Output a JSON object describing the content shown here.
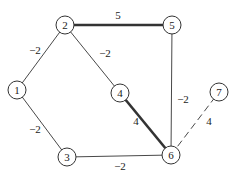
{
  "graph": {
    "nodes": [
      {
        "id": "1",
        "label": "1",
        "x": 17,
        "y": 90
      },
      {
        "id": "2",
        "label": "2",
        "x": 65,
        "y": 25
      },
      {
        "id": "3",
        "label": "3",
        "x": 67,
        "y": 157
      },
      {
        "id": "4",
        "label": "4",
        "x": 120,
        "y": 93
      },
      {
        "id": "5",
        "label": "5",
        "x": 172,
        "y": 25
      },
      {
        "id": "6",
        "label": "6",
        "x": 171,
        "y": 155
      },
      {
        "id": "7",
        "label": "7",
        "x": 219,
        "y": 92
      }
    ],
    "edges": [
      {
        "from": "1",
        "to": "2",
        "weight": "−2",
        "style": "thin",
        "label_x": 35,
        "label_y": 50
      },
      {
        "from": "1",
        "to": "3",
        "weight": "−2",
        "style": "thin",
        "label_x": 35,
        "label_y": 129
      },
      {
        "from": "2",
        "to": "5",
        "weight": "5",
        "style": "bold",
        "label_x": 118,
        "label_y": 15
      },
      {
        "from": "2",
        "to": "4",
        "weight": "−2",
        "style": "thin",
        "label_x": 105,
        "label_y": 53
      },
      {
        "from": "5",
        "to": "6",
        "weight": "−2",
        "style": "thin",
        "label_x": 183,
        "label_y": 99
      },
      {
        "from": "4",
        "to": "6",
        "weight": "4",
        "style": "bold",
        "label_x": 136,
        "label_y": 121
      },
      {
        "from": "3",
        "to": "6",
        "weight": "−2",
        "style": "thin",
        "label_x": 120,
        "label_y": 166
      },
      {
        "from": "6",
        "to": "7",
        "weight": "4",
        "style": "dashed",
        "label_x": 209,
        "label_y": 121
      }
    ]
  },
  "colors": {
    "stroke": "#333333",
    "background": "#ffffff"
  }
}
